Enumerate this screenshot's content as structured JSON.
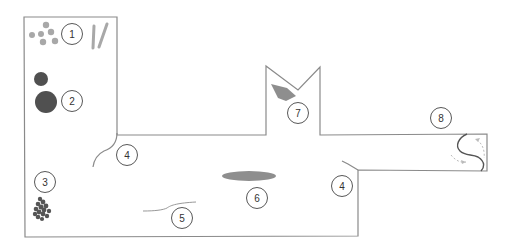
{
  "diagram": {
    "type": "floor-plan",
    "colors": {
      "wall": "#8a8a8a",
      "light_item": "#a8a8a8",
      "dark_item": "#505050",
      "label_stroke": "#444444",
      "arrow": "#bbbbbb"
    },
    "labels": [
      {
        "id": 1,
        "text": "1",
        "cx": 72,
        "cy": 34
      },
      {
        "id": 2,
        "text": "2",
        "cx": 72,
        "cy": 101
      },
      {
        "id": 3,
        "text": "3",
        "cx": 45,
        "cy": 182
      },
      {
        "id": 4,
        "text": "4",
        "cx": 127,
        "cy": 155
      },
      {
        "id": 5,
        "text": "4",
        "cx": 342,
        "cy": 186
      },
      {
        "id": 6,
        "text": "5",
        "cx": 182,
        "cy": 218
      },
      {
        "id": 7,
        "text": "6",
        "cx": 257,
        "cy": 198
      },
      {
        "id": 8,
        "text": "7",
        "cx": 298,
        "cy": 113
      },
      {
        "id": 9,
        "text": "8",
        "cx": 441,
        "cy": 118
      }
    ],
    "items": [
      {
        "marker": "1",
        "description": "cluster of small grey dots and two grey strokes"
      },
      {
        "marker": "2",
        "description": "two dark filled circles"
      },
      {
        "marker": "3",
        "description": "dark irregular cluster"
      },
      {
        "marker": "4",
        "description": "curved wall segments at corridor junctions"
      },
      {
        "marker": "5",
        "description": "thin wavy line on floor"
      },
      {
        "marker": "6",
        "description": "grey elongated ellipse"
      },
      {
        "marker": "7",
        "description": "grey wedge shape in notch"
      },
      {
        "marker": "8",
        "description": "S-shaped curve with dashed circulation arrows"
      }
    ]
  }
}
